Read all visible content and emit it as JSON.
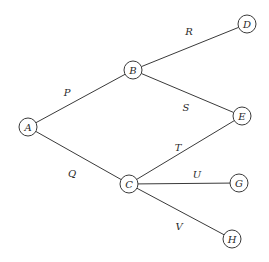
{
  "diagram": {
    "type": "tree-graph",
    "node_radius": 9,
    "nodes": [
      {
        "id": "A",
        "label": "A",
        "x": 28,
        "y": 127
      },
      {
        "id": "B",
        "label": "B",
        "x": 133,
        "y": 70
      },
      {
        "id": "C",
        "label": "C",
        "x": 129,
        "y": 184
      },
      {
        "id": "D",
        "label": "D",
        "x": 247,
        "y": 24
      },
      {
        "id": "E",
        "label": "E",
        "x": 242,
        "y": 116
      },
      {
        "id": "G",
        "label": "G",
        "x": 239,
        "y": 183
      },
      {
        "id": "H",
        "label": "H",
        "x": 232,
        "y": 239
      }
    ],
    "edges": [
      {
        "id": "P",
        "label": "P",
        "from": "A",
        "to": "B",
        "label_x": 67,
        "label_y": 92
      },
      {
        "id": "Q",
        "label": "Q",
        "from": "A",
        "to": "C",
        "label_x": 72,
        "label_y": 173
      },
      {
        "id": "R",
        "label": "R",
        "from": "B",
        "to": "D",
        "label_x": 189,
        "label_y": 31
      },
      {
        "id": "S",
        "label": "S",
        "from": "B",
        "to": "E",
        "label_x": 186,
        "label_y": 107
      },
      {
        "id": "T",
        "label": "T",
        "from": "C",
        "to": "E",
        "label_x": 178,
        "label_y": 147
      },
      {
        "id": "U",
        "label": "U",
        "from": "C",
        "to": "G",
        "label_x": 197,
        "label_y": 174
      },
      {
        "id": "V",
        "label": "V",
        "from": "C",
        "to": "H",
        "label_x": 179,
        "label_y": 226
      }
    ]
  }
}
